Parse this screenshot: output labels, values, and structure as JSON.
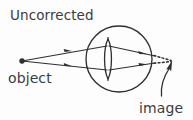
{
  "figure": {
    "title": "Uncorrected",
    "background_color": "#fdfdfe",
    "ink_color": "#2e2e33",
    "text_color": "#3b3b40",
    "width": 193,
    "height": 120
  },
  "labels": {
    "title": "Uncorrected",
    "object": "object",
    "image": "image"
  },
  "elements": {
    "object_point": {
      "name": "object-point-source",
      "x": 22,
      "y": 61,
      "radius": 2.6
    },
    "eyeball": {
      "name": "eyeball-circle",
      "cx": 119,
      "cy": 59,
      "rx": 33,
      "ry": 33
    },
    "lens": {
      "name": "eye-lens",
      "cx": 108,
      "cy": 59,
      "half_height": 20,
      "half_width": 4.5
    },
    "rays": [
      {
        "name": "upper-ray",
        "from_x": 22,
        "from_y": 61,
        "to_x": 108,
        "to_y": 46,
        "arrow_at": 0.62
      },
      {
        "name": "lower-ray",
        "from_x": 22,
        "from_y": 61,
        "to_x": 108,
        "to_y": 70,
        "arrow_at": 0.62
      },
      {
        "name": "upper-refracted-ray",
        "from_x": 108,
        "from_y": 46,
        "to_x": 155,
        "to_y": 56,
        "arrow_at": 0.66
      },
      {
        "name": "lower-refracted-ray",
        "from_x": 108,
        "from_y": 70,
        "to_x": 155,
        "to_y": 63,
        "arrow_at": 0.66
      }
    ],
    "dotted_rays": [
      {
        "name": "upper-dotted-extension",
        "from_x": 155,
        "from_y": 56,
        "to_x": 171,
        "to_y": 61
      },
      {
        "name": "lower-dotted-extension",
        "from_x": 155,
        "from_y": 63,
        "to_x": 171,
        "to_y": 62
      }
    ],
    "image_arrow": {
      "name": "image-pointer-arrow",
      "tail_x": 162,
      "tail_y": 95,
      "tip_x": 172,
      "tip_y": 60,
      "style": "curved-with-arrowhead"
    }
  },
  "text_positions": {
    "title": {
      "x": 10,
      "y": 20
    },
    "object": {
      "x": 8,
      "y": 83
    },
    "image": {
      "x": 139,
      "y": 113
    }
  }
}
